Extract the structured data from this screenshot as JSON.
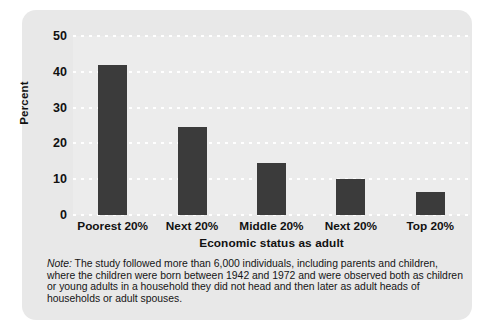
{
  "figure": {
    "panel_background": "#e8e8e8",
    "plot_background": "#ececec",
    "bar_color": "#3b3b3b",
    "gridline_color": "#ffffff"
  },
  "axes": {
    "y_title": "Percent",
    "x_title": "Economic status as adult",
    "y_ticks": [
      "0",
      "10",
      "20",
      "30",
      "40",
      "50"
    ],
    "x_categories": [
      "Poorest 20%",
      "Next 20%",
      "Middle 20%",
      "Next 20%",
      "Top 20%"
    ]
  },
  "note": {
    "label": "Note:",
    "text": " The study followed more than 6,000 individuals, including parents and children, where the children were born between 1942 and 1972 and were observed both as children or young adults in a household they did not head and then later as adult heads of households or adult spouses."
  },
  "chart_data": {
    "type": "bar",
    "title": "",
    "xlabel": "Economic status as adult",
    "ylabel": "Percent",
    "categories": [
      "Poorest 20%",
      "Next 20%",
      "Middle 20%",
      "Next 20%",
      "Top 20%"
    ],
    "values": [
      42,
      24.5,
      14.5,
      10,
      6.5
    ],
    "ylim": [
      0,
      50
    ],
    "yticks": [
      0,
      10,
      20,
      30,
      40,
      50
    ],
    "grid": true,
    "legend": false
  }
}
